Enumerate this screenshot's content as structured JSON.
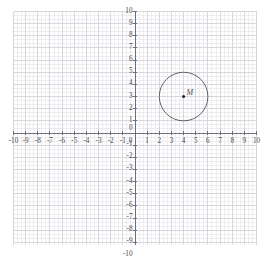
{
  "figure": {
    "kind": "cartesian-coordinate-grid",
    "background_color": "#ffffff",
    "minor_grid_color": "#ededf0",
    "major_grid_color": "#d6d6dc",
    "axis_color": "#6e6e78",
    "tick_color": "#6e6e78",
    "label_color": "#4a4a4a",
    "shape_color": "#545458"
  },
  "chart_data": {
    "type": "scatter",
    "title": "",
    "xlabel": "",
    "ylabel": "",
    "xlim": [
      -10,
      10
    ],
    "ylim": [
      -10,
      10
    ],
    "grid": true,
    "minor_subdivisions": 3,
    "legend": "none",
    "x_tick_labels": [
      "-10",
      "-9",
      "-8",
      "-7",
      "-6",
      "-5",
      "-4",
      "-3",
      "-2",
      "-1",
      "0",
      "1",
      "2",
      "3",
      "4",
      "5",
      "6",
      "7",
      "8",
      "9",
      "10"
    ],
    "x_tick_values": [
      -10,
      -9,
      -8,
      -7,
      -6,
      -5,
      -4,
      -3,
      -2,
      -1,
      0,
      1,
      2,
      3,
      4,
      5,
      6,
      7,
      8,
      9,
      10
    ],
    "y_tick_labels": [
      "10",
      "9",
      "8",
      "7",
      "6",
      "5",
      "4",
      "3",
      "2",
      "1",
      "0",
      "-1",
      "-2",
      "-3",
      "-4",
      "-5",
      "-6",
      "-7",
      "-8",
      "-9",
      "-10"
    ],
    "y_tick_values": [
      10,
      9,
      8,
      7,
      6,
      5,
      4,
      3,
      2,
      1,
      0,
      -1,
      -2,
      -3,
      -4,
      -5,
      -6,
      -7,
      -8,
      -9,
      -10
    ],
    "shapes": [
      {
        "type": "circle",
        "label": "M",
        "center_x": 4,
        "center_y": 3,
        "radius": 2,
        "filled": false,
        "center_marked": true
      }
    ],
    "points": [
      {
        "label": "M",
        "x": 4,
        "y": 3
      }
    ]
  },
  "annotations": {
    "point_m_label": "M",
    "origin_x_label": "0",
    "origin_y_label": "0"
  }
}
